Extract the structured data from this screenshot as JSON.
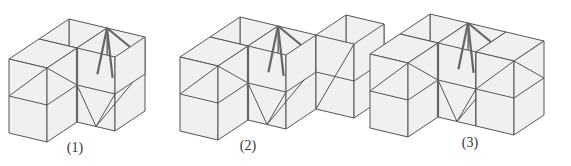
{
  "diagram": {
    "figures": [
      {
        "label": "(1)",
        "label_pos": [
          75,
          157
        ]
      },
      {
        "label": "(2)",
        "label_pos": [
          248,
          155
        ]
      },
      {
        "label": "(3)",
        "label_pos": [
          470,
          152
        ]
      }
    ],
    "colors": {
      "face": "#f0f0f0",
      "edge": "#555555",
      "background": "#ffffff"
    }
  }
}
